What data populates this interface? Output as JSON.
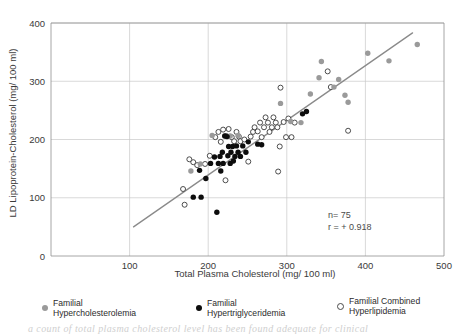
{
  "chart_data": {
    "type": "scatter",
    "title": "",
    "xlabel": "Total Plasma Cholesterol (mg/ 100 ml)",
    "ylabel": "LD Lipoprotein-Cholesterol (mg/ 100 ml)",
    "xlim": [
      0,
      500
    ],
    "ylim": [
      0,
      400
    ],
    "xticks": [
      100,
      200,
      300,
      400,
      500
    ],
    "yticks": [
      0,
      100,
      200,
      300,
      400
    ],
    "grid": true,
    "legend_position": "below",
    "annotations": {
      "n_label": "n= 75",
      "r_label": "r = + 0.918"
    },
    "trendline": {
      "label": "regression-line",
      "x_start": 105,
      "y_start": 50,
      "x_end": 460,
      "y_end": 383,
      "color": "#8a8a8a"
    },
    "series": [
      {
        "name": "Familial Hypercholesterolemia",
        "marker": "filled-circle",
        "color": "#9a9a9a",
        "points": [
          [
            178,
            146
          ],
          [
            190,
            158
          ],
          [
            205,
            207
          ],
          [
            228,
            206
          ],
          [
            238,
            207
          ],
          [
            292,
            262
          ],
          [
            305,
            231
          ],
          [
            318,
            229
          ],
          [
            330,
            278
          ],
          [
            341,
            306
          ],
          [
            344,
            334
          ],
          [
            360,
            290
          ],
          [
            366,
            303
          ],
          [
            374,
            276
          ],
          [
            378,
            264
          ],
          [
            403,
            348
          ],
          [
            430,
            335
          ],
          [
            466,
            363
          ]
        ]
      },
      {
        "name": "Familial Hypertriglyceridemia",
        "marker": "filled-circle",
        "color": "#0d0d0d",
        "points": [
          [
            181,
            101
          ],
          [
            191,
            101
          ],
          [
            189,
            147
          ],
          [
            197,
            133
          ],
          [
            203,
            159
          ],
          [
            208,
            170
          ],
          [
            211,
            75
          ],
          [
            213,
            159
          ],
          [
            215,
            171
          ],
          [
            216,
            146
          ],
          [
            218,
            178
          ],
          [
            219,
            159
          ],
          [
            221,
            206
          ],
          [
            224,
            205
          ],
          [
            225,
            172
          ],
          [
            226,
            188
          ],
          [
            228,
            159
          ],
          [
            229,
            178
          ],
          [
            231,
            188
          ],
          [
            232,
            163
          ],
          [
            234,
            171
          ],
          [
            236,
            189
          ],
          [
            238,
            178
          ],
          [
            241,
            171
          ],
          [
            244,
            189
          ],
          [
            248,
            178
          ],
          [
            251,
            196
          ],
          [
            263,
            192
          ],
          [
            268,
            191
          ],
          [
            320,
            244
          ],
          [
            325,
            248
          ]
        ]
      },
      {
        "name": "Familial Combined Hyperlipidemia",
        "marker": "open-circle",
        "color": "#ffffff",
        "edge_color": "#3a3a3a",
        "points": [
          [
            168,
            115
          ],
          [
            170,
            88
          ],
          [
            176,
            166
          ],
          [
            181,
            161
          ],
          [
            186,
            156
          ],
          [
            196,
            158
          ],
          [
            202,
            172
          ],
          [
            209,
            204
          ],
          [
            213,
            213
          ],
          [
            216,
            196
          ],
          [
            219,
            217
          ],
          [
            222,
            130
          ],
          [
            223,
            206
          ],
          [
            226,
            218
          ],
          [
            230,
            204
          ],
          [
            233,
            197
          ],
          [
            236,
            213
          ],
          [
            239,
            205
          ],
          [
            241,
            197
          ],
          [
            246,
            200
          ],
          [
            251,
            162
          ],
          [
            254,
            205
          ],
          [
            257,
            213
          ],
          [
            259,
            221
          ],
          [
            263,
            214
          ],
          [
            266,
            229
          ],
          [
            268,
            204
          ],
          [
            271,
            221
          ],
          [
            273,
            238
          ],
          [
            276,
            229
          ],
          [
            278,
            213
          ],
          [
            281,
            221
          ],
          [
            283,
            238
          ],
          [
            286,
            229
          ],
          [
            288,
            221
          ],
          [
            289,
            145
          ],
          [
            291,
            188
          ],
          [
            292,
            289
          ],
          [
            296,
            230
          ],
          [
            299,
            204
          ],
          [
            302,
            236
          ],
          [
            306,
            204
          ],
          [
            310,
            229
          ],
          [
            352,
            317
          ],
          [
            356,
            290
          ],
          [
            378,
            215
          ]
        ]
      }
    ]
  },
  "legend": {
    "entries": [
      {
        "marker": "gray",
        "label": "Familial\nHypercholesterolemia"
      },
      {
        "marker": "black",
        "label": "Familial\nHypertriglyceridemia"
      },
      {
        "marker": "open",
        "label": "Familial Combined\nHyperlipidemia"
      }
    ]
  },
  "page_caption_fragment": "a count of total plasma cholesterol level has been found adequate for clinical"
}
